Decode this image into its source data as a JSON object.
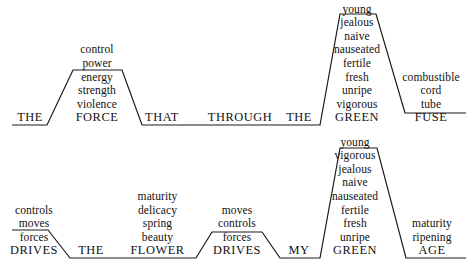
{
  "figure": {
    "type": "linguistic-substitution-diagram",
    "line_color": "#1a1a1a",
    "background_color": "#ffffff",
    "text_color": "#111111",
    "width": 472,
    "height": 273
  },
  "rows": [
    {
      "id": "row-1",
      "sentence": "THE FORCE THAT THROUGH THE GREEN FUSE",
      "baseline_y": 125,
      "slots": [
        {
          "id": "slot-1-the",
          "head": "THE",
          "alternatives": [],
          "center_x": 30,
          "level": "base"
        },
        {
          "id": "slot-1-force",
          "head": "FORCE",
          "alternatives": [
            "control",
            "power",
            "energy",
            "strength",
            "violence"
          ],
          "center_x": 97,
          "level": "raised"
        },
        {
          "id": "slot-1-that",
          "head": "THAT",
          "alternatives": [],
          "center_x": 162,
          "level": "base"
        },
        {
          "id": "slot-1-through",
          "head": "THROUGH",
          "alternatives": [],
          "center_x": 240,
          "level": "base"
        },
        {
          "id": "slot-1-the-2",
          "head": "THE",
          "alternatives": [],
          "center_x": 299,
          "level": "base"
        },
        {
          "id": "slot-1-green",
          "head": "GREEN",
          "alternatives": [
            "young",
            "jealous",
            "naive",
            "nauseated",
            "fertile",
            "fresh",
            "unripe",
            "vigorous"
          ],
          "center_x": 357,
          "level": "high"
        },
        {
          "id": "slot-1-fuse",
          "head": "FUSE",
          "alternatives": [
            "combustible",
            "cord",
            "tube"
          ],
          "center_x": 431,
          "level": "low-raised"
        }
      ]
    },
    {
      "id": "row-2",
      "sentence": "DRIVES THE FLOWER DRIVES MY GREEN AGE",
      "baseline_y": 258,
      "slots": [
        {
          "id": "slot-2-drives",
          "head": "DRIVES",
          "alternatives": [
            "controls",
            "moves",
            "forces"
          ],
          "center_x": 32,
          "level": "raised"
        },
        {
          "id": "slot-2-the",
          "head": "THE",
          "alternatives": [],
          "center_x": 90,
          "level": "base"
        },
        {
          "id": "slot-2-flower",
          "head": "FLOWER",
          "alternatives": [
            "maturity",
            "delicacy",
            "spring",
            "beauty"
          ],
          "center_x": 157,
          "level": "base"
        },
        {
          "id": "slot-2-drives-2",
          "head": "DRIVES",
          "alternatives": [
            "moves",
            "controls",
            "forces"
          ],
          "center_x": 237,
          "level": "raised"
        },
        {
          "id": "slot-2-my",
          "head": "MY",
          "alternatives": [],
          "center_x": 299,
          "level": "base"
        },
        {
          "id": "slot-2-green",
          "head": "GREEN",
          "alternatives": [
            "young",
            "vigorous",
            "jealous",
            "naive",
            "nauseated",
            "fertile",
            "fresh",
            "unripe"
          ],
          "center_x": 355,
          "level": "high"
        },
        {
          "id": "slot-2-age",
          "head": "AGE",
          "alternatives": [
            "maturity",
            "ripening"
          ],
          "center_x": 432,
          "level": "base"
        }
      ]
    }
  ],
  "terrain": {
    "row1_path": "M 12,125 L 47,125 L 73,70 L 122,70 L 142,125 L 320,125 L 340,14 L 376,14 L 405,113 L 466,113",
    "row2_path": "M 12,230 L 48,230 L 70,258 L 196,258 L 212,232 L 262,232 L 280,258 L 320,258 L 340,148 L 377,148 L 406,258 L 466,258",
    "stroke_width": 1.2
  }
}
